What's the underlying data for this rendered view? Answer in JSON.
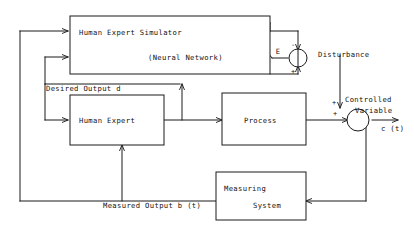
{
  "diagram": {
    "blocks": [
      {
        "id": "simulator",
        "label_line1": "Human Expert Simulator",
        "label_line2": "(Neural Network)"
      },
      {
        "id": "human_expert",
        "label_line1": "Human Expert"
      },
      {
        "id": "process",
        "label_line1": "Process"
      },
      {
        "id": "measuring_system",
        "label_line1": "Measuring",
        "label_line2": "System"
      }
    ],
    "signals": {
      "desired_output": "Desired Output d",
      "measured_output": "Measured Output b (t)",
      "disturbance": "Disturbance",
      "controlled_variable_line1": "Controlled",
      "controlled_variable_line2": "Variable",
      "controlled_output": "c (t)",
      "error": "E"
    },
    "sum_junctions": [
      {
        "id": "error-junction",
        "sign_top": "-",
        "sign_bottom": "+"
      },
      {
        "id": "output-junction",
        "sign_top": "+",
        "sign_left": "+"
      }
    ],
    "colors": {
      "line": "#1a1a1a",
      "background": "#ffffff",
      "text": "#111111"
    }
  }
}
